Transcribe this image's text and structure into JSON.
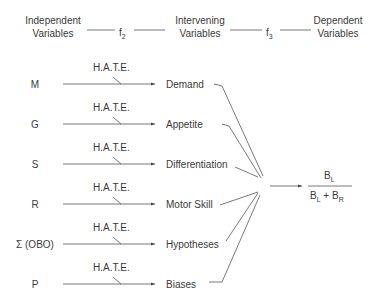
{
  "header": {
    "independent": [
      "Independent",
      "Variables"
    ],
    "f2": "f",
    "f2_sub": "2",
    "intervening": [
      "Intervening",
      "Variables"
    ],
    "f3": "f",
    "f3_sub": "3",
    "dependent": [
      "Dependent",
      "Variables"
    ]
  },
  "rows": [
    {
      "input": "M",
      "modifier": "H.A.T.E.",
      "output": "Demand"
    },
    {
      "input": "G",
      "modifier": "H.A.T.E.",
      "output": "Appetite"
    },
    {
      "input": "S",
      "modifier": "H.A.T.E.",
      "output": "Differentiation"
    },
    {
      "input": "R",
      "modifier": "H.A.T.E.",
      "output": "Motor Skill"
    },
    {
      "input": "Σ (OBO)",
      "modifier": "H.A.T.E.",
      "output": "Hypotheses"
    },
    {
      "input": "P",
      "modifier": "H.A.T.E.",
      "output": "Biases"
    }
  ],
  "result": {
    "numerator": "B",
    "numerator_sub": "L",
    "den_a": "B",
    "den_a_sub": "L",
    "plus": "+",
    "den_b": "B",
    "den_b_sub": "R"
  }
}
